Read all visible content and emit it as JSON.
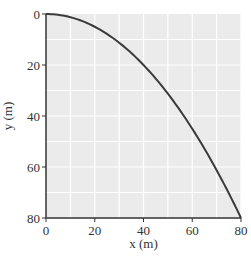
{
  "chart_data": {
    "type": "line",
    "title": "",
    "xlabel": "x (m)",
    "ylabel": "y (m)",
    "xlim": [
      0,
      80
    ],
    "ylim": [
      0,
      80
    ],
    "y_inverted": true,
    "grid": true,
    "grid_step": 10,
    "x_ticks": [
      0,
      20,
      40,
      60,
      80
    ],
    "y_ticks": [
      0,
      20,
      40,
      60,
      80
    ],
    "series": [
      {
        "name": "trajectory",
        "equation": "y = x^2 / 80",
        "x": [
          0,
          10,
          20,
          30,
          40,
          50,
          60,
          70,
          80
        ],
        "y": [
          0,
          1.25,
          5,
          11.25,
          20,
          31.25,
          45,
          61.25,
          80
        ]
      }
    ],
    "legend": null
  },
  "style": {
    "plot_bg": "#ebebeb",
    "grid_color": "#ffffff",
    "curve_color": "#3a3a3a",
    "axis_color": "#333333"
  }
}
